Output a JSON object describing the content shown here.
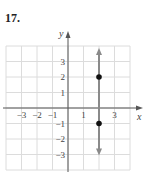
{
  "problem": {
    "number": "17."
  },
  "chart_data": {
    "type": "line",
    "title": "",
    "xlabel": "x",
    "ylabel": "y",
    "xlim": [
      -4,
      4
    ],
    "ylim": [
      -4,
      4
    ],
    "grid": true,
    "x_tick_labels": [
      "−3",
      "−2",
      "−1",
      "1",
      "3"
    ],
    "x_tick_values": [
      -3,
      -2,
      -1,
      1,
      3
    ],
    "y_tick_labels": [
      "3",
      "2",
      "1",
      "−1",
      "−2",
      "−3"
    ],
    "y_tick_values": [
      3,
      2,
      1,
      -1,
      -2,
      -3
    ],
    "series": [
      {
        "name": "vertical line x = 2",
        "equation": "x = 2",
        "x": [
          2,
          2
        ],
        "y": [
          -3,
          3.8
        ],
        "arrows": "both",
        "color": "#8a8a8a"
      }
    ],
    "points": [
      {
        "x": 2,
        "y": 2,
        "color": "#111111"
      },
      {
        "x": 2,
        "y": -1,
        "color": "#111111"
      }
    ],
    "colors": {
      "grid": "#dcdcdc",
      "axis": "#555555",
      "line": "#8a8a8a",
      "point": "#111111"
    }
  }
}
